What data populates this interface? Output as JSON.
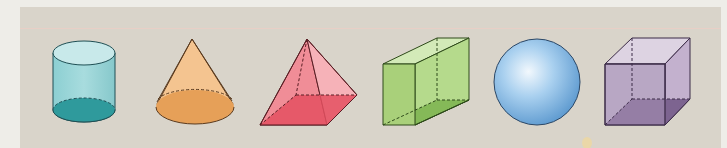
{
  "figure": {
    "title": "",
    "background_color": "#eeede8",
    "panel_color": "#d9d4ca",
    "shapes": [
      {
        "name": "cylinder",
        "color": "#5fb8bd",
        "base_color": "#2f9a9c"
      },
      {
        "name": "cone",
        "color": "#f2b87a",
        "base_color": "#e39a4e"
      },
      {
        "name": "square pyramid",
        "color": "#f08a94",
        "base_color": "#e8505e"
      },
      {
        "name": "rectangular prism",
        "color": "#a9d07a",
        "base_color": "#7fb552"
      },
      {
        "name": "sphere",
        "color": "#8fc0e8",
        "base_color": "#5f9fd6"
      },
      {
        "name": "cube",
        "color": "#b7a6c4",
        "base_color": "#7d6590"
      }
    ]
  }
}
